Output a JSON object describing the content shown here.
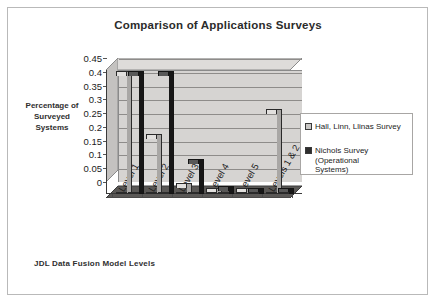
{
  "chart_data": {
    "type": "bar",
    "title": "Comparison of Applications Surveys",
    "xlabel": "JDL Data Fusion Model Levels",
    "ylabel": "Percentage of\nSurveyed\nSystems",
    "ylabel_lines": [
      "Percentage of",
      "Surveyed",
      "Systems"
    ],
    "categories": [
      "Level 1",
      "Level 2",
      "Level 3",
      "Level 4",
      "Level 5",
      "Levels 1 & 2"
    ],
    "series": [
      {
        "name": "Hall, Linn, Llinas Survey",
        "color": "#c9c7c5",
        "values": [
          0.43,
          0.2,
          0.02,
          0.005,
          0.005,
          0.29
        ]
      },
      {
        "name": "Nichols Survey (Operational Systems)",
        "color": "#2e2e2e",
        "values": [
          0.43,
          0.43,
          0.11,
          0.01,
          0.005,
          0.0
        ]
      }
    ],
    "ylim": [
      0,
      0.45
    ],
    "yticks": [
      "0",
      "0.05",
      "0.1",
      "0.15",
      "0.2",
      "0.25",
      "0.3",
      "0.35",
      "0.4",
      "0.45"
    ],
    "ytick_values": [
      0,
      0.05,
      0.1,
      0.15,
      0.2,
      0.25,
      0.3,
      0.35,
      0.4,
      0.45
    ],
    "grid": true,
    "legend_position": "right",
    "style": "3d-column",
    "legend_entries": [
      "Hall, Linn, Llinas Survey",
      "Nichols Survey (Operational\n  Systems)"
    ]
  }
}
